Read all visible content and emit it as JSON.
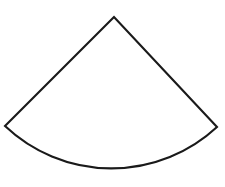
{
  "figure": {
    "name": "circular-sector",
    "type": "geometric-shape",
    "background_color": "#ffffff",
    "stroke_color": "#1a1a1a",
    "fill_color": "#ffffff",
    "stroke_width": 2.1,
    "canvas": {
      "width": 225,
      "height": 187
    },
    "geometry": {
      "apex": {
        "x": 114,
        "y": 17
      },
      "radius": 155,
      "arc_start": {
        "x": 5,
        "y": 126
      },
      "arc_end": {
        "x": 217,
        "y": 127
      },
      "arc_bottom": {
        "x": 114,
        "y": 175
      },
      "sweep_degrees": 97,
      "start_angle_degrees": 44,
      "end_angle_degrees": 141,
      "large_arc_flag": 0,
      "sweep_flag": 1
    },
    "path_d": "M 114 17 L 5 126 A 155 155 0 0 0 217 127 Z",
    "edges": [
      {
        "name": "left-radius-edge",
        "kind": "line",
        "from": "apex",
        "to": "arc_start"
      },
      {
        "name": "right-radius-edge",
        "kind": "line",
        "from": "arc_end",
        "to": "apex"
      },
      {
        "name": "bottom-arc-edge",
        "kind": "arc",
        "from": "arc_start",
        "to": "arc_end"
      }
    ],
    "vertices": [
      {
        "name": "apex-vertex",
        "x": 114,
        "y": 17
      },
      {
        "name": "left-vertex",
        "x": 5,
        "y": 126
      },
      {
        "name": "right-vertex",
        "x": 217,
        "y": 127
      }
    ],
    "labels": [],
    "annotations": []
  }
}
